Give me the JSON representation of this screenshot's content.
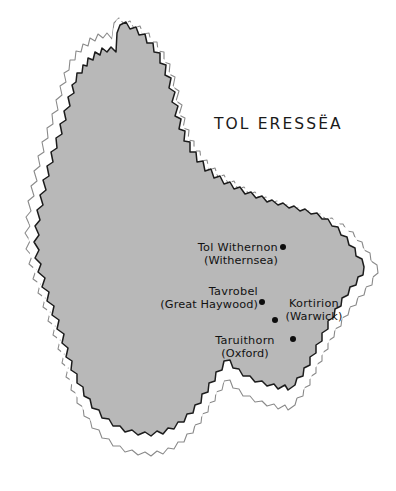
{
  "map": {
    "title": "TOL ERESSËA",
    "background_color": "#ffffff",
    "land_color": "#b8b8b8",
    "coast_ink_color": "#1c1c1c",
    "coast_halo_color": "#ffffff",
    "coast_outer_color": "#6e6e6e",
    "label_color": "#121212",
    "marker_color": "#0d0d0d"
  },
  "places": [
    {
      "native": "Tol Withernon",
      "modern": "(Withernsea)",
      "marker": "city-dot"
    },
    {
      "native": "Tavrobel",
      "modern": "(Great Haywood)",
      "marker": "city-dot"
    },
    {
      "native": "Kortirion",
      "modern": "(Warwick)",
      "marker": "city-dot"
    },
    {
      "native": "Taruithorn",
      "modern": "(Oxford)",
      "marker": "city-dot"
    }
  ]
}
